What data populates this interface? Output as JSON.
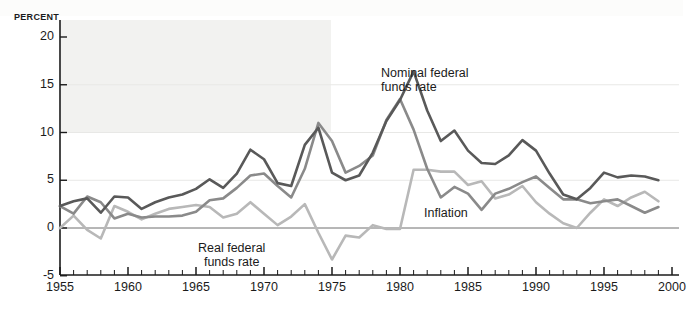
{
  "figure": {
    "background_color": "#ffffff",
    "plot_tint_color": "#f2f2f0",
    "axis_color": "#1b1b1b",
    "zero_line_color": "#6f6f6f"
  },
  "axes": {
    "y_unit_label": "PERCENT",
    "y_ticks": [
      20,
      15,
      10,
      5,
      0,
      -5
    ],
    "y_tick_labels": [
      "20",
      "15",
      "10",
      "5",
      "0",
      "-5"
    ],
    "x_tick_labels": [
      "1955",
      "1960",
      "1965",
      "1970",
      "1975",
      "1980",
      "1985",
      "1990",
      "1995",
      "2000"
    ],
    "x_minor_tick_step_years": 1
  },
  "annotations": [
    {
      "name": "nominal-label",
      "line1": "Nominal federal",
      "line2": "funds rate"
    },
    {
      "name": "real-label",
      "line1": "Real federal",
      "line2": "funds rate"
    },
    {
      "name": "inflation-label",
      "line1": "Inflation",
      "line2": ""
    }
  ],
  "chart_data": {
    "type": "line",
    "title": "",
    "subtitle": "",
    "xlabel": "",
    "ylabel": "PERCENT",
    "xlim": [
      1955,
      2000
    ],
    "ylim": [
      -5,
      20
    ],
    "grid": false,
    "legend": "inline-annotations",
    "x": [
      1955,
      1956,
      1957,
      1958,
      1959,
      1960,
      1961,
      1962,
      1963,
      1964,
      1965,
      1966,
      1967,
      1968,
      1969,
      1970,
      1971,
      1972,
      1973,
      1974,
      1975,
      1976,
      1977,
      1978,
      1979,
      1980,
      1981,
      1982,
      1983,
      1984,
      1985,
      1986,
      1987,
      1988,
      1989,
      1990,
      1991,
      1992,
      1993,
      1994,
      1995,
      1996,
      1997,
      1998,
      1999
    ],
    "series": [
      {
        "name": "Nominal federal funds rate",
        "color": "#595959",
        "width": 2.6,
        "values": [
          2.3,
          2.8,
          3.1,
          1.6,
          3.3,
          3.2,
          2.0,
          2.7,
          3.2,
          3.5,
          4.1,
          5.1,
          4.2,
          5.7,
          8.2,
          7.2,
          4.7,
          4.4,
          8.7,
          10.5,
          5.8,
          5.0,
          5.5,
          7.9,
          11.2,
          13.4,
          16.4,
          12.3,
          9.1,
          10.2,
          8.1,
          6.8,
          6.7,
          7.6,
          9.2,
          8.1,
          5.7,
          3.5,
          3.0,
          4.2,
          5.8,
          5.3,
          5.5,
          5.4,
          5.0
        ]
      },
      {
        "name": "Inflation",
        "color": "#8a8a8a",
        "width": 2.6,
        "values": [
          2.3,
          1.5,
          3.3,
          2.7,
          1.0,
          1.5,
          1.1,
          1.2,
          1.2,
          1.3,
          1.7,
          2.9,
          3.1,
          4.2,
          5.5,
          5.7,
          4.4,
          3.2,
          6.2,
          11.0,
          9.1,
          5.8,
          6.5,
          7.6,
          11.3,
          13.5,
          10.3,
          6.2,
          3.2,
          4.3,
          3.6,
          1.9,
          3.6,
          4.1,
          4.8,
          5.4,
          4.2,
          3.0,
          3.0,
          2.6,
          2.8,
          3.0,
          2.3,
          1.6,
          2.2
        ]
      },
      {
        "name": "Real federal funds rate",
        "color": "#b8b8b8",
        "width": 2.6,
        "values": [
          0.0,
          1.3,
          -0.2,
          -1.1,
          2.3,
          1.7,
          0.9,
          1.5,
          2.0,
          2.2,
          2.4,
          2.2,
          1.1,
          1.5,
          2.7,
          1.5,
          0.3,
          1.2,
          2.5,
          -0.5,
          -3.3,
          -0.8,
          -1.0,
          0.3,
          -0.1,
          -0.1,
          6.1,
          6.1,
          5.9,
          5.9,
          4.5,
          4.9,
          3.1,
          3.5,
          4.4,
          2.7,
          1.5,
          0.5,
          0.0,
          1.6,
          3.0,
          2.3,
          3.2,
          3.8,
          2.8
        ]
      }
    ]
  }
}
